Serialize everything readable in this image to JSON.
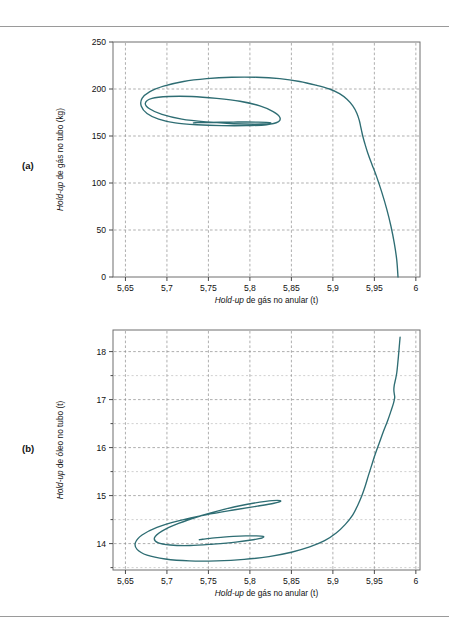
{
  "figure": {
    "panels": [
      {
        "tag": "(a)",
        "xlabel_italic": "Hold-up",
        "xlabel_rest": " de gás no anular (t)",
        "ylabel_italic": "Hold-up",
        "ylabel_rest": " de gás no tubo (kg)",
        "x_ticks": [
          "5,65",
          "5,7",
          "5,75",
          "5,8",
          "5,85",
          "5,9",
          "5,95",
          "6"
        ],
        "y_ticks": [
          "250",
          "200",
          "150",
          "100",
          "50",
          "0"
        ],
        "line_color": "#2e6d73"
      },
      {
        "tag": "(b)",
        "xlabel_italic": "Hold-up",
        "xlabel_rest": " de gás no anular (t)",
        "ylabel_italic": "Hold-up",
        "ylabel_rest": " de óleo no tubo (t)",
        "x_ticks": [
          "5,65",
          "5,7",
          "5,75",
          "5,8",
          "5,85",
          "5,9",
          "5,95",
          "6"
        ],
        "y_ticks": [
          "18",
          "17",
          "16",
          "15",
          "14"
        ],
        "line_color": "#2e6d73"
      }
    ]
  },
  "chart_data": [
    {
      "type": "line",
      "title": "(a)",
      "xlabel": "Hold-up de gás no anular (t)",
      "ylabel": "Hold-up de gás no tubo (kg)",
      "xlim": [
        5.635,
        6.005
      ],
      "ylim": [
        0,
        250
      ],
      "xticks": [
        5.65,
        5.7,
        5.75,
        5.8,
        5.85,
        5.9,
        5.95,
        6
      ],
      "yticks": [
        0,
        50,
        100,
        150,
        200,
        250
      ],
      "grid": true,
      "legend": null,
      "series": [
        {
          "name": "trajetória espiral",
          "x": [
            5.9785,
            5.977,
            5.974,
            5.97,
            5.965,
            5.959,
            5.953,
            5.947,
            5.942,
            5.9385,
            5.936,
            5.9345,
            5.9335,
            5.932,
            5.929,
            5.924,
            5.917,
            5.908,
            5.896,
            5.88,
            5.86,
            5.836,
            5.808,
            5.778,
            5.748,
            5.72,
            5.696,
            5.679,
            5.67,
            5.669,
            5.676,
            5.69,
            5.71,
            5.736,
            5.766,
            5.796,
            5.82,
            5.834,
            5.836,
            5.828,
            5.812,
            5.788,
            5.76,
            5.73,
            5.702,
            5.682,
            5.674,
            5.679,
            5.694,
            5.718,
            5.748,
            5.78,
            5.806,
            5.822,
            5.825,
            5.82,
            5.81,
            5.796,
            5.78,
            5.764,
            5.75,
            5.74,
            5.734,
            5.732
          ],
          "y": [
            0,
            18,
            36,
            54,
            72,
            90,
            106,
            120,
            132,
            142,
            150,
            156,
            160,
            166,
            174,
            182,
            189,
            195,
            200,
            204,
            208,
            211,
            212.5,
            212.5,
            211,
            208,
            203,
            197,
            190,
            182,
            174,
            168,
            164,
            162,
            161,
            161,
            162,
            165,
            170,
            176,
            182,
            187,
            190,
            192,
            192,
            190,
            185,
            179,
            173,
            168,
            165,
            163,
            162.5,
            163,
            164,
            164.5,
            164.8,
            164.9,
            164.8,
            164.6,
            164.4,
            164.2,
            164.1,
            164.0
          ]
        }
      ]
    },
    {
      "type": "line",
      "title": "(b)",
      "xlabel": "Hold-up de gás no anular (t)",
      "ylabel": "Hold-up de óleo no tubo (t)",
      "xlim": [
        5.635,
        6.005
      ],
      "ylim": [
        13.45,
        18.45
      ],
      "xticks": [
        5.65,
        5.7,
        5.75,
        5.8,
        5.85,
        5.9,
        5.95,
        6
      ],
      "yticks": [
        14,
        15,
        16,
        17,
        18
      ],
      "minor_yticks": [
        13.5,
        14.5,
        15.5,
        16.5,
        17.5
      ],
      "grid": true,
      "legend": null,
      "series": [
        {
          "name": "trajetória espiral",
          "x": [
            5.981,
            5.98,
            5.979,
            5.978,
            5.977,
            5.9755,
            5.974,
            5.9735,
            5.974,
            5.9745,
            5.973,
            5.97,
            5.966,
            5.961,
            5.956,
            5.951,
            5.9465,
            5.9425,
            5.939,
            5.935,
            5.93,
            5.924,
            5.915,
            5.904,
            5.89,
            5.872,
            5.85,
            5.823,
            5.793,
            5.76,
            5.727,
            5.698,
            5.676,
            5.664,
            5.662,
            5.67,
            5.688,
            5.715,
            5.747,
            5.78,
            5.809,
            5.829,
            5.837,
            5.833,
            5.819,
            5.797,
            5.77,
            5.741,
            5.714,
            5.694,
            5.685,
            5.689,
            5.704,
            5.728,
            5.756,
            5.783,
            5.804,
            5.815,
            5.816,
            5.808,
            5.795,
            5.78,
            5.765,
            5.752,
            5.743,
            5.739
          ],
          "y": [
            18.3,
            18.1,
            17.9,
            17.72,
            17.56,
            17.42,
            17.3,
            17.2,
            17.12,
            17.04,
            16.92,
            16.76,
            16.56,
            16.34,
            16.1,
            15.86,
            15.62,
            15.4,
            15.2,
            15.0,
            14.8,
            14.6,
            14.4,
            14.22,
            14.06,
            13.93,
            13.82,
            13.73,
            13.67,
            13.64,
            13.64,
            13.68,
            13.76,
            13.88,
            14.02,
            14.18,
            14.34,
            14.48,
            14.6,
            14.7,
            14.78,
            14.84,
            14.88,
            14.9,
            14.88,
            14.82,
            14.72,
            14.58,
            14.42,
            14.26,
            14.12,
            14.02,
            13.97,
            13.96,
            13.99,
            14.03,
            14.08,
            14.12,
            14.15,
            14.16,
            14.16,
            14.15,
            14.13,
            14.11,
            14.09,
            14.08
          ]
        }
      ]
    }
  ]
}
